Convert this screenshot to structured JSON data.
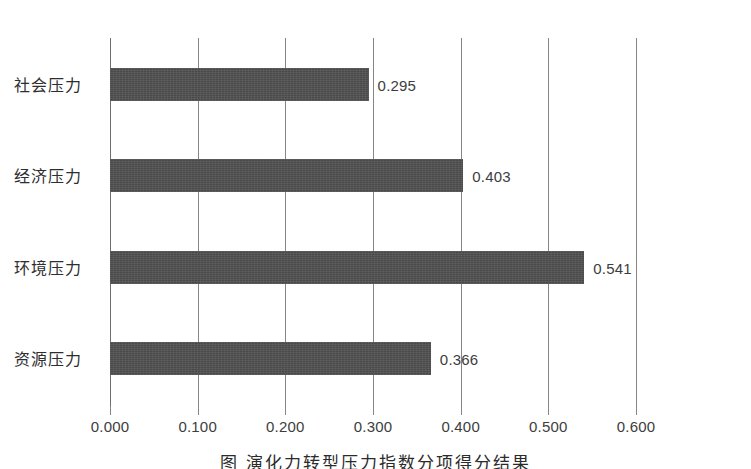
{
  "chart_data": {
    "type": "bar",
    "orientation": "horizontal",
    "title": "",
    "xlabel": "",
    "ylabel": "",
    "categories": [
      "社会压力",
      "经济压力",
      "环境压力",
      "资源压力"
    ],
    "values": [
      0.295,
      0.403,
      0.541,
      0.366
    ],
    "value_labels": [
      "0.295",
      "0.403",
      "0.541",
      "0.366"
    ],
    "xlim": [
      0.0,
      0.6
    ],
    "xticks": [
      0.0,
      0.1,
      0.2,
      0.3,
      0.4,
      0.5,
      0.6
    ],
    "xtick_labels": [
      "0.000",
      "0.100",
      "0.200",
      "0.300",
      "0.400",
      "0.500",
      "0.600"
    ],
    "grid": "vertical",
    "legend": "none",
    "series": [
      {
        "name": "",
        "color": "#4a4a4a",
        "values": [
          0.295,
          0.403,
          0.541,
          0.366
        ]
      }
    ]
  },
  "caption": {
    "text": "图     演化力转型压力指数分项得分结果"
  },
  "colors": {
    "bar": "#4a4a4a",
    "gridline": "#868686",
    "text": "#2e2e2e",
    "background": "#ffffff"
  }
}
